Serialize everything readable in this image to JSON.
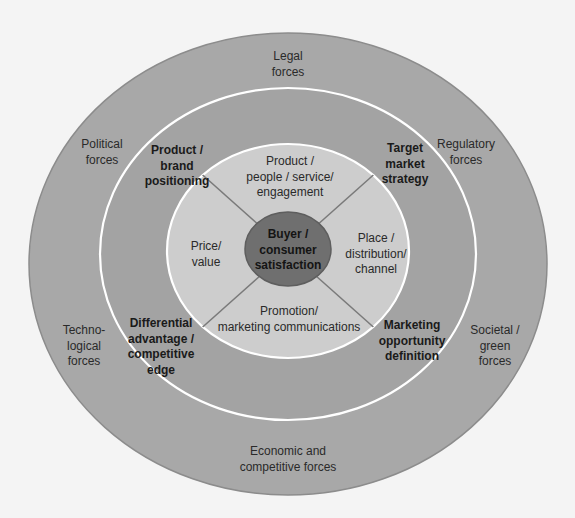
{
  "colors": {
    "background": "#f4f4f4",
    "outer_ring": "#a8a8a8",
    "outer_stroke": "#8c8c8c",
    "middle_ring": "#a3a3a3",
    "inner_mix": "#cdcdcd",
    "center": "#6f6f6f",
    "separator_white": "#ffffff",
    "divider_line": "#7a7a7a"
  },
  "diagram": {
    "title": "",
    "center": {
      "label": "Buyer /\nconsumer\nsatisfaction"
    },
    "marketing_mix": [
      {
        "id": "product",
        "label": "Product /\npeople / service/\nengagement"
      },
      {
        "id": "place",
        "label": "Place /\ndistribution/\nchannel"
      },
      {
        "id": "promotion",
        "label": "Promotion/\nmarketing communications"
      },
      {
        "id": "price",
        "label": "Price/\nvalue"
      }
    ],
    "strategy_ring": [
      {
        "id": "positioning",
        "label": "Product /\nbrand\npositioning"
      },
      {
        "id": "target",
        "label": "Target\nmarket\nstrategy"
      },
      {
        "id": "opportunity",
        "label": "Marketing\nopportunity\ndefinition"
      },
      {
        "id": "differential",
        "label": "Differential\nadvantage /\ncompetitive\nedge"
      }
    ],
    "environment_ring": [
      {
        "id": "legal",
        "label": "Legal\nforces"
      },
      {
        "id": "regulatory",
        "label": "Regulatory\nforces"
      },
      {
        "id": "societal",
        "label": "Societal /\ngreen\nforces"
      },
      {
        "id": "economic",
        "label": "Economic and\ncompetitive forces"
      },
      {
        "id": "technological",
        "label": "Techno-\nlogical\nforces"
      },
      {
        "id": "political",
        "label": "Political\nforces"
      }
    ]
  }
}
